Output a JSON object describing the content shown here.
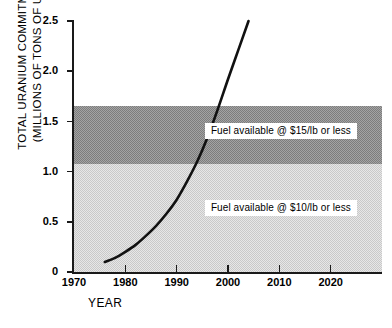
{
  "chart_data": {
    "type": "line",
    "title": "",
    "xlabel": "YEAR",
    "ylabel_line1": "TOTAL URANIUM COMMITMENTS",
    "ylabel_line2_pre": "(MILLIONS OF TONS OF U",
    "ylabel_line2_sub1": "3",
    "ylabel_line2_mid": "O",
    "ylabel_line2_sub2": "8",
    "ylabel_line2_post": " )",
    "xlim": [
      1970,
      2030
    ],
    "ylim": [
      0,
      2.5
    ],
    "grid": false,
    "legend": "none",
    "xticks": [
      1970,
      1980,
      1990,
      2000,
      2010,
      2020
    ],
    "xtick_labels": [
      "1970",
      "1980",
      "1990",
      "2000",
      "2010",
      "2020"
    ],
    "yticks": [
      0,
      0.5,
      1.0,
      1.5,
      2.0,
      2.5
    ],
    "ytick_labels": [
      "0",
      "0.5",
      "1.0",
      "1.5",
      "2.0",
      "2.5"
    ],
    "series": [
      {
        "name": "Total uranium commitments",
        "x": [
          1976,
          1978,
          1980,
          1982,
          1984,
          1986,
          1988,
          1990,
          1992,
          1994,
          1996,
          1998,
          2000,
          2002,
          2004
        ],
        "values": [
          0.1,
          0.14,
          0.2,
          0.27,
          0.36,
          0.46,
          0.58,
          0.72,
          0.9,
          1.1,
          1.34,
          1.62,
          1.92,
          2.21,
          2.5
        ],
        "color": "#111111",
        "linewidth": 2.6
      }
    ],
    "bands": [
      {
        "name": "fuel-15",
        "label": "Fuel available @ $15/lb or less",
        "y_from": 1.08,
        "y_to": 1.65,
        "color": "#7d7d7d",
        "shade": "dark-hatch"
      },
      {
        "name": "fuel-10",
        "label": "Fuel available @ $10/lb or less",
        "y_from": 0.0,
        "y_to": 1.08,
        "color": "#c9c9c9",
        "shade": "light-hatch"
      }
    ],
    "annotations": [
      {
        "text": "Fuel available @ $15/lb or less",
        "x": 1995.5,
        "y": 1.39
      },
      {
        "text": "Fuel available @ $10/lb or less",
        "x": 1995.5,
        "y": 0.63
      }
    ]
  }
}
